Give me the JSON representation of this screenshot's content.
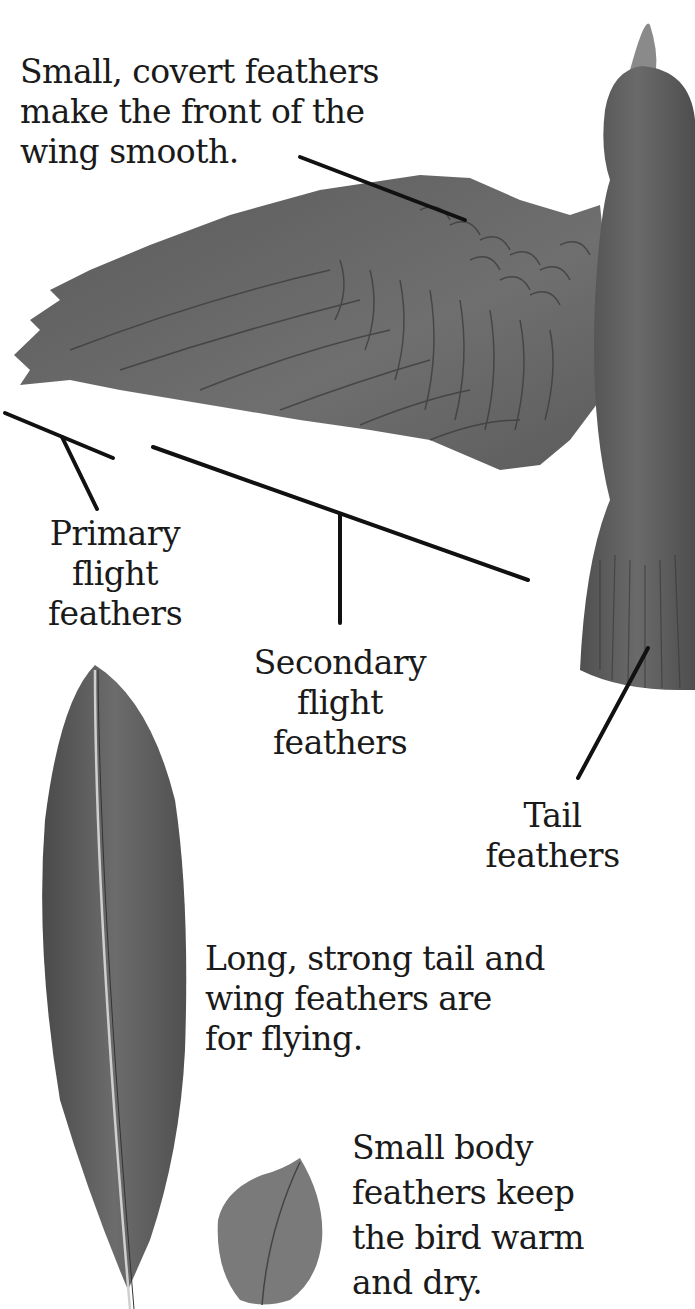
{
  "diagram": {
    "colors": {
      "ink": "#1a1a1a",
      "feather_dark": "#555555",
      "feather_mid": "#6e6e6e",
      "feather_light": "#8a8a8a",
      "background": "#ffffff"
    },
    "labels": {
      "covert": [
        "Small, covert feathers",
        "make the front of the",
        "wing smooth."
      ],
      "primary": [
        "Primary",
        "flight",
        "feathers"
      ],
      "secondary": [
        "Secondary",
        "flight",
        "feathers"
      ],
      "tail": [
        "Tail",
        "feathers"
      ],
      "long_strong": [
        "Long, strong tail and",
        "wing feathers are",
        "for flying."
      ],
      "body": [
        "Small body",
        "feathers keep",
        "the bird warm",
        "and dry."
      ]
    }
  }
}
